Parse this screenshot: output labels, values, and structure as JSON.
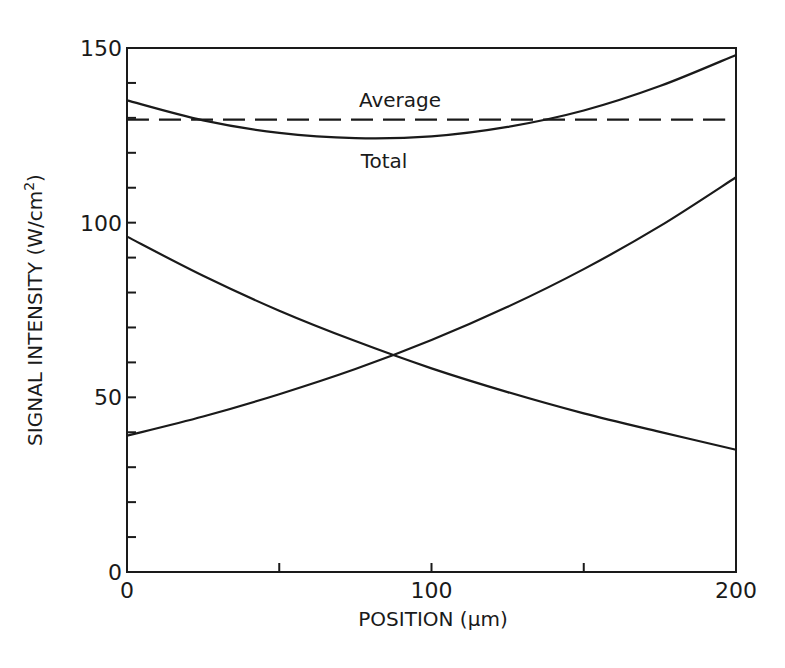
{
  "chart_data": {
    "type": "line",
    "title": "",
    "xlabel": "POSITION (µm)",
    "ylabel": "SIGNAL INTENSITY (W/cm²)",
    "ylabel_main": "SIGNAL INTENSITY (W/cm",
    "ylabel_sup": "2",
    "ylabel_close": ")",
    "xlim": [
      0,
      200
    ],
    "ylim": [
      0,
      150
    ],
    "x_ticks": [
      0,
      50,
      100,
      150,
      200
    ],
    "x_tick_labels": [
      "0",
      "",
      "100",
      "",
      "200"
    ],
    "y_ticks": [
      0,
      10,
      20,
      30,
      40,
      50,
      60,
      70,
      80,
      90,
      100,
      110,
      120,
      130,
      140,
      150
    ],
    "y_tick_labels": {
      "0": "0",
      "50": "50",
      "100": "100",
      "150": "150"
    },
    "grid": false,
    "legend": "none (inline annotations)",
    "annotations": [
      {
        "text": "Average",
        "x": 75,
        "y": 134
      },
      {
        "text": "Total",
        "x": 76,
        "y": 117
      }
    ],
    "x": [
      0,
      25,
      50,
      75,
      100,
      125,
      150,
      175,
      200
    ],
    "series": [
      {
        "name": "Forward signal (decreasing)",
        "style": "solid",
        "values": [
          96.0,
          84.8,
          74.8,
          66.1,
          58.3,
          51.5,
          45.4,
          40.1,
          35.0
        ]
      },
      {
        "name": "Backward signal (increasing)",
        "style": "solid",
        "values": [
          39.0,
          44.5,
          50.9,
          58.1,
          66.4,
          75.9,
          86.7,
          99.0,
          113.0
        ]
      },
      {
        "name": "Total",
        "style": "solid",
        "values": [
          135.0,
          129.3,
          125.7,
          124.2,
          124.7,
          127.4,
          132.1,
          139.1,
          148.0
        ]
      },
      {
        "name": "Average",
        "style": "dashed",
        "values": [
          129.5,
          129.5,
          129.5,
          129.5,
          129.5,
          129.5,
          129.5,
          129.5,
          129.5
        ]
      }
    ]
  },
  "colors": {
    "ink": "#1a1a1a",
    "background": "#ffffff"
  }
}
